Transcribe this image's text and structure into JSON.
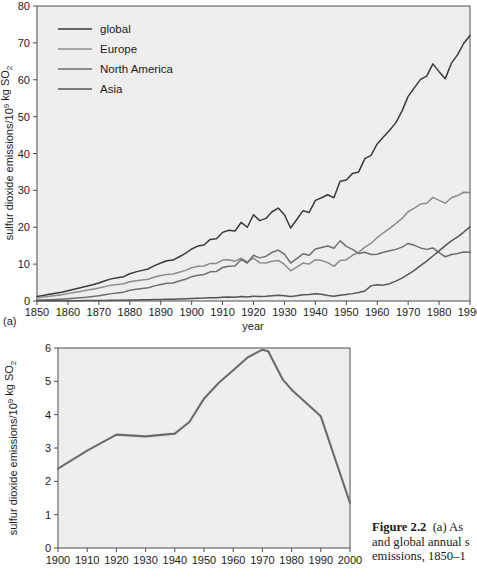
{
  "figure": {
    "panel_a_tag": "(a)",
    "caption_lines": [
      "Figure 2.2",
      "(a) As",
      "and global annual s",
      "emissions, 1850–1"
    ],
    "caption_bold_lead": "Figure 2.2",
    "caption_rest_line1": "(a) As",
    "caption_line2": "and global annual s",
    "caption_line3": "emissions, 1850–1"
  },
  "colors": {
    "plot_background": "#eeeeee",
    "axis": "#4d4d4d",
    "global": "#3a3a3a",
    "europe": "#8c8c8c",
    "north_america": "#6e6e6e",
    "asia": "#555555",
    "panel_b_line": "#6b6b6b"
  },
  "chart_data": [
    {
      "type": "line",
      "id": "panel-a",
      "title": "",
      "xlabel": "year",
      "ylabel": "sulfur dioxide emissions/10⁹ kg SO₂",
      "xlim": [
        1850,
        1990
      ],
      "ylim": [
        0,
        80
      ],
      "xticks": [
        1850,
        1860,
        1870,
        1880,
        1890,
        1900,
        1910,
        1920,
        1930,
        1940,
        1950,
        1960,
        1970,
        1980,
        1990
      ],
      "yticks": [
        0,
        10,
        20,
        30,
        40,
        50,
        60,
        70,
        80
      ],
      "grid": false,
      "legend_position": "top-left",
      "x": [
        1850,
        1852,
        1854,
        1856,
        1858,
        1860,
        1862,
        1864,
        1866,
        1868,
        1870,
        1872,
        1874,
        1876,
        1878,
        1880,
        1882,
        1884,
        1886,
        1888,
        1890,
        1892,
        1894,
        1896,
        1898,
        1900,
        1902,
        1904,
        1906,
        1908,
        1910,
        1912,
        1914,
        1916,
        1918,
        1920,
        1922,
        1924,
        1926,
        1928,
        1930,
        1932,
        1934,
        1936,
        1938,
        1940,
        1942,
        1944,
        1946,
        1948,
        1950,
        1952,
        1954,
        1956,
        1958,
        1960,
        1962,
        1964,
        1966,
        1968,
        1970,
        1972,
        1974,
        1976,
        1978,
        1980,
        1982,
        1984,
        1986,
        1988,
        1990
      ],
      "series": [
        {
          "name": "global",
          "color": "#3a3a3a",
          "values": [
            1.2,
            1.5,
            1.8,
            2.1,
            2.4,
            2.8,
            3.2,
            3.6,
            4.0,
            4.4,
            4.9,
            5.5,
            6.0,
            6.3,
            6.6,
            7.4,
            7.9,
            8.3,
            8.7,
            9.6,
            10.3,
            10.9,
            11.1,
            12.0,
            12.9,
            14.1,
            14.9,
            15.2,
            16.7,
            16.9,
            18.6,
            19.2,
            19.0,
            21.3,
            20.0,
            23.4,
            21.8,
            22.4,
            24.2,
            25.2,
            23.4,
            19.8,
            22.1,
            24.5,
            24.0,
            27.3,
            28.0,
            28.8,
            28.0,
            32.5,
            32.8,
            34.6,
            35.0,
            38.6,
            39.5,
            42.6,
            44.5,
            46.3,
            48.3,
            51.5,
            55.5,
            57.8,
            60.1,
            61.0,
            64.3,
            62.2,
            60.3,
            64.5,
            66.8,
            69.9,
            72.0
          ]
        },
        {
          "name": "Europe",
          "color": "#8c8c8c",
          "values": [
            0.9,
            1.1,
            1.3,
            1.5,
            1.7,
            2.0,
            2.3,
            2.6,
            2.9,
            3.2,
            3.5,
            3.9,
            4.3,
            4.5,
            4.7,
            5.2,
            5.5,
            5.7,
            5.9,
            6.5,
            6.9,
            7.2,
            7.3,
            7.8,
            8.3,
            9.0,
            9.4,
            9.5,
            10.2,
            10.2,
            11.1,
            11.2,
            10.8,
            11.6,
            10.6,
            11.6,
            10.4,
            10.3,
            10.8,
            11.0,
            9.9,
            8.2,
            9.2,
            10.3,
            10.0,
            11.2,
            11.0,
            10.4,
            9.4,
            11.0,
            11.2,
            12.4,
            13.2,
            14.6,
            15.6,
            17.2,
            18.5,
            19.7,
            21.0,
            22.4,
            24.2,
            25.2,
            26.3,
            26.5,
            28.1,
            27.3,
            26.5,
            28.0,
            28.6,
            29.5,
            29.4
          ]
        },
        {
          "name": "North America",
          "color": "#6e6e6e",
          "values": [
            0.25,
            0.3,
            0.35,
            0.42,
            0.5,
            0.6,
            0.72,
            0.86,
            1.0,
            1.2,
            1.4,
            1.7,
            2.0,
            2.2,
            2.4,
            2.9,
            3.2,
            3.4,
            3.6,
            4.1,
            4.5,
            4.8,
            4.9,
            5.4,
            5.9,
            6.6,
            7.0,
            7.2,
            7.9,
            8.0,
            9.1,
            9.4,
            9.5,
            11.2,
            10.3,
            12.4,
            11.7,
            12.1,
            13.2,
            13.8,
            12.7,
            10.3,
            11.5,
            12.8,
            12.4,
            14.1,
            14.5,
            14.9,
            14.3,
            16.3,
            14.8,
            14.0,
            12.9,
            13.2,
            12.6,
            12.7,
            13.2,
            13.6,
            14.0,
            14.6,
            15.6,
            15.1,
            14.4,
            14.0,
            14.4,
            13.1,
            12.0,
            12.6,
            12.9,
            13.3,
            13.2
          ]
        },
        {
          "name": "Asia",
          "color": "#555555",
          "values": [
            0.05,
            0.05,
            0.06,
            0.06,
            0.07,
            0.08,
            0.09,
            0.1,
            0.11,
            0.12,
            0.14,
            0.16,
            0.18,
            0.2,
            0.22,
            0.25,
            0.28,
            0.31,
            0.34,
            0.38,
            0.42,
            0.46,
            0.48,
            0.54,
            0.6,
            0.68,
            0.74,
            0.78,
            0.86,
            0.9,
            1.0,
            1.06,
            1.05,
            1.2,
            1.1,
            1.3,
            1.25,
            1.32,
            1.45,
            1.55,
            1.45,
            1.25,
            1.45,
            1.7,
            1.75,
            1.95,
            1.8,
            1.5,
            1.3,
            1.55,
            1.75,
            2.0,
            2.3,
            2.7,
            4.1,
            4.4,
            4.3,
            4.7,
            5.4,
            6.2,
            7.2,
            8.3,
            9.6,
            10.8,
            12.2,
            13.6,
            15.0,
            16.3,
            17.4,
            18.7,
            20.1
          ]
        }
      ]
    },
    {
      "type": "line",
      "id": "panel-b",
      "title": "",
      "xlabel": "year",
      "ylabel": "sulfur dioxide emissions/10⁹ kg SO₂",
      "xlim": [
        1900,
        2000
      ],
      "ylim": [
        0,
        6
      ],
      "xticks": [
        1900,
        1910,
        1920,
        1930,
        1940,
        1950,
        1960,
        1970,
        1980,
        1990,
        2000
      ],
      "yticks": [
        0,
        1,
        2,
        3,
        4,
        5,
        6
      ],
      "grid": false,
      "x": [
        1900,
        1910,
        1920,
        1930,
        1940,
        1945,
        1950,
        1955,
        1960,
        1965,
        1970,
        1972,
        1977,
        1980,
        1990,
        2000
      ],
      "values": [
        2.38,
        2.92,
        3.4,
        3.35,
        3.43,
        3.78,
        4.48,
        4.95,
        5.33,
        5.72,
        5.95,
        5.9,
        5.05,
        4.75,
        3.95,
        1.35
      ],
      "series": [
        {
          "name": "panel-b-line",
          "color": "#6b6b6b",
          "values": [
            2.38,
            2.92,
            3.4,
            3.35,
            3.43,
            3.78,
            4.48,
            4.95,
            5.33,
            5.72,
            5.95,
            5.9,
            5.05,
            4.75,
            3.95,
            1.35
          ]
        }
      ]
    }
  ],
  "panel_a": {
    "legend": [
      {
        "label": "global",
        "color": "#3a3a3a"
      },
      {
        "label": "Europe",
        "color": "#8c8c8c"
      },
      {
        "label": "North America",
        "color": "#6e6e6e"
      },
      {
        "label": "Asia",
        "color": "#555555"
      }
    ],
    "y_axis_title": "sulfur dioxide emissions/10⁹ kg SO₂",
    "x_axis_title": "year",
    "y_tick_labels": [
      "0",
      "10",
      "20",
      "30",
      "40",
      "50",
      "60",
      "70",
      "80"
    ],
    "x_tick_labels": [
      "1850",
      "1860",
      "1870",
      "1880",
      "1890",
      "1900",
      "1910",
      "1920",
      "1930",
      "1940",
      "1950",
      "1960",
      "1970",
      "1980",
      "1990"
    ]
  },
  "panel_b": {
    "y_axis_title": "sulfur dioxide emissions/10⁹ kg SO₂",
    "x_axis_title": "year",
    "y_tick_labels": [
      "0",
      "1",
      "2",
      "3",
      "4",
      "5",
      "6"
    ],
    "x_tick_labels": [
      "1900",
      "1910",
      "1920",
      "1930",
      "1940",
      "1950",
      "1960",
      "1970",
      "1980",
      "1990",
      "2000"
    ]
  }
}
